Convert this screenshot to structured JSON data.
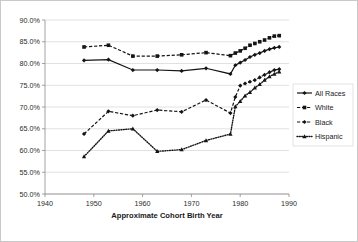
{
  "chart_data": {
    "type": "line",
    "title": "",
    "xlabel": "Approximate Cohort Birth Year",
    "ylabel": "",
    "xlim": [
      1940,
      1990
    ],
    "ylim": [
      50,
      90
    ],
    "grid": true,
    "legend_position": "right",
    "xticks": [
      1940,
      1950,
      1960,
      1970,
      1980,
      1990
    ],
    "xtick_labels": [
      "1940",
      "1950",
      "1960",
      "1970",
      "1980",
      "1990"
    ],
    "yticks": [
      50,
      55,
      60,
      65,
      70,
      75,
      80,
      85,
      90
    ],
    "ytick_labels": [
      "50.0%",
      "55.0%",
      "60.0%",
      "65.0%",
      "70.0%",
      "75.0%",
      "80.0%",
      "85.0%",
      "90.0%"
    ],
    "series": [
      {
        "name": "All Races",
        "line_style": "solid",
        "marker": "diamond",
        "color": "#141414",
        "x": [
          1948,
          1953,
          1958,
          1963,
          1968,
          1973,
          1978,
          1979,
          1980,
          1981,
          1982,
          1983,
          1984,
          1985,
          1986,
          1987,
          1988
        ],
        "values": [
          80.7,
          80.9,
          78.5,
          78.5,
          78.3,
          78.9,
          77.6,
          79.6,
          80.2,
          80.8,
          81.5,
          82.0,
          82.4,
          82.9,
          83.3,
          83.6,
          83.8
        ]
      },
      {
        "name": "White",
        "line_style": "dashed",
        "marker": "square",
        "color": "#141414",
        "x": [
          1948,
          1953,
          1958,
          1963,
          1968,
          1973,
          1978,
          1979,
          1980,
          1981,
          1982,
          1983,
          1984,
          1985,
          1986,
          1987,
          1988
        ],
        "values": [
          83.8,
          84.2,
          81.7,
          81.7,
          82.0,
          82.5,
          81.8,
          82.4,
          82.9,
          83.5,
          84.2,
          84.6,
          85.0,
          85.4,
          85.9,
          86.3,
          86.4
        ]
      },
      {
        "name": "Black",
        "line_style": "dashed",
        "marker": "diamond",
        "color": "#141414",
        "x": [
          1948,
          1953,
          1958,
          1963,
          1968,
          1973,
          1978,
          1979,
          1980,
          1981,
          1982,
          1983,
          1984,
          1985,
          1986,
          1987,
          1988
        ],
        "values": [
          63.8,
          69.0,
          68.0,
          69.3,
          68.9,
          71.6,
          68.6,
          72.3,
          74.9,
          75.4,
          75.8,
          76.2,
          76.8,
          77.4,
          78.0,
          78.5,
          78.7
        ]
      },
      {
        "name": "Hispanic",
        "line_style": "dotted",
        "marker": "triangle",
        "color": "#141414",
        "x": [
          1948,
          1953,
          1958,
          1963,
          1968,
          1973,
          1978,
          1979,
          1980,
          1981,
          1982,
          1983,
          1984,
          1985,
          1986,
          1987,
          1988
        ],
        "values": [
          58.6,
          64.5,
          65.0,
          59.8,
          60.2,
          62.3,
          63.8,
          70.1,
          71.3,
          72.6,
          73.4,
          74.4,
          75.2,
          76.2,
          77.0,
          77.6,
          78.1
        ]
      }
    ]
  },
  "legend": {
    "items": [
      {
        "label": "All Races"
      },
      {
        "label": "White"
      },
      {
        "label": "Black"
      },
      {
        "label": "Hispanic"
      }
    ]
  }
}
